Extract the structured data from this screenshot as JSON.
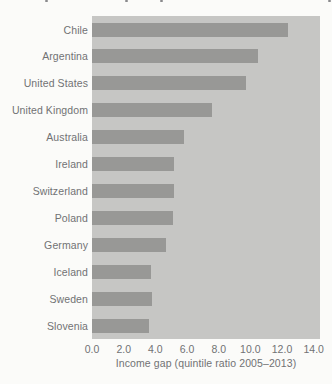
{
  "figure": {
    "kind": "scanned horizontal bar chart, no visible title (cropped at top)"
  },
  "chart_data": {
    "type": "bar",
    "orientation": "horizontal",
    "title": "",
    "categories": [
      "Chile",
      "Argentina",
      "United States",
      "United Kingdom",
      "Australia",
      "Ireland",
      "Switzerland",
      "Poland",
      "Germany",
      "Iceland",
      "Sweden",
      "Slovenia"
    ],
    "values": [
      12.4,
      10.5,
      9.7,
      7.6,
      5.8,
      5.2,
      5.2,
      5.1,
      4.7,
      3.7,
      3.8,
      3.6
    ],
    "xlabel": "Income gap (quintile ratio 2005–2013)",
    "ylabel": "",
    "xticks": [
      "0.0",
      "2.0",
      "4.0",
      "6.0",
      "8.0",
      "10.0",
      "12.0",
      "14.0"
    ],
    "xtick_values": [
      0,
      2,
      4,
      6,
      8,
      10,
      12,
      14
    ],
    "xlim": [
      0,
      14.4
    ],
    "grid": false,
    "legend": false,
    "colors": {
      "bar": "#989896",
      "plot_background": "#c6c6c4",
      "page_background": "#fbfbf9",
      "text": "#717274"
    }
  },
  "scan_artifacts": {
    "description": "tiny remnants of cropped text row at top edge",
    "top_marks_x": [
      45,
      125,
      160,
      328
    ]
  }
}
